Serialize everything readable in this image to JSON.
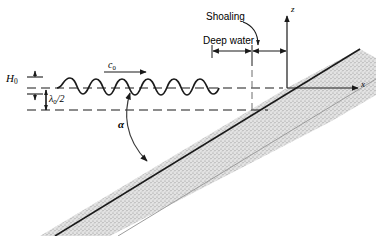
{
  "figure": {
    "background_color": "#ffffff",
    "line_color": "#1a1a1a",
    "slope_fill_color": "#d9d9d9"
  },
  "labels": {
    "wave_height": "H",
    "wave_height_sub": "0",
    "half_wavelength": "/2",
    "half_wavelength_symbol": "λ",
    "half_wavelength_sub": "0",
    "celerity": "c",
    "celerity_sub": "0",
    "angle": "α",
    "shoaling": "Shoaling",
    "deep_water": "Deep water",
    "axis_z": "z",
    "axis_x": "x"
  },
  "geometry": {
    "still_water_level_y": 88,
    "lower_dashed_level_y": 110,
    "origin_x": 287,
    "origin_y": 88,
    "wave_start_x": 57,
    "wave_end_x": 214,
    "wave_count": 6,
    "wave_amplitude": 6,
    "slope_angle_deg": 28,
    "deep_water_span_x": [
      212,
      252
    ],
    "shoaling_span_x": [
      252,
      287
    ],
    "dimension_line_y": 51
  }
}
